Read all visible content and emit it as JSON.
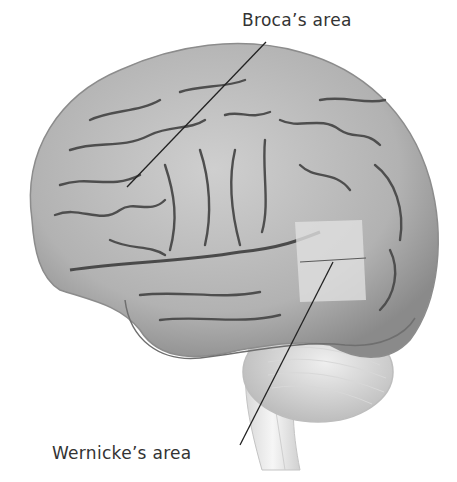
{
  "diagram": {
    "labels": [
      {
        "id": "broca",
        "text": "Broca’s area",
        "points_to": "frontal lobe (inferior frontal gyrus)"
      },
      {
        "id": "wernicke",
        "text": "Wernicke’s area",
        "points_to": "temporal lobe (superior temporal gyrus)"
      }
    ],
    "colors": {
      "background": "#ffffff",
      "cortex": "#b9b9b9",
      "cortex_dark": "#7a7a7a",
      "sulcus": "#4a4a4a",
      "highlight_region": "#e2e2e2",
      "cerebellum": "#d4d4d4",
      "brainstem": "#ececec",
      "leader_line": "#222222",
      "label_text": "#333333"
    }
  }
}
